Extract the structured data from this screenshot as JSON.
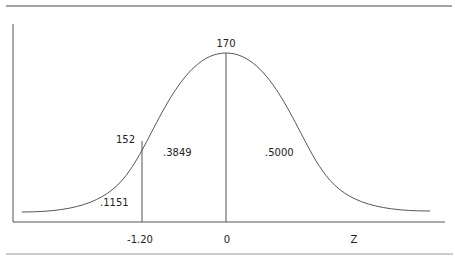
{
  "diagram": {
    "type": "normal-distribution-curve",
    "colors": {
      "line": "#555555",
      "text": "#222222",
      "rule": "#444444"
    },
    "labels": {
      "peak_value": "170",
      "cutoff_value": "152",
      "left_tail_area": ".1151",
      "middle_area": ".3849",
      "right_half_area": ".5000"
    },
    "x_axis": {
      "ticks": [
        "-1.20",
        "0"
      ],
      "label": "Z"
    }
  }
}
